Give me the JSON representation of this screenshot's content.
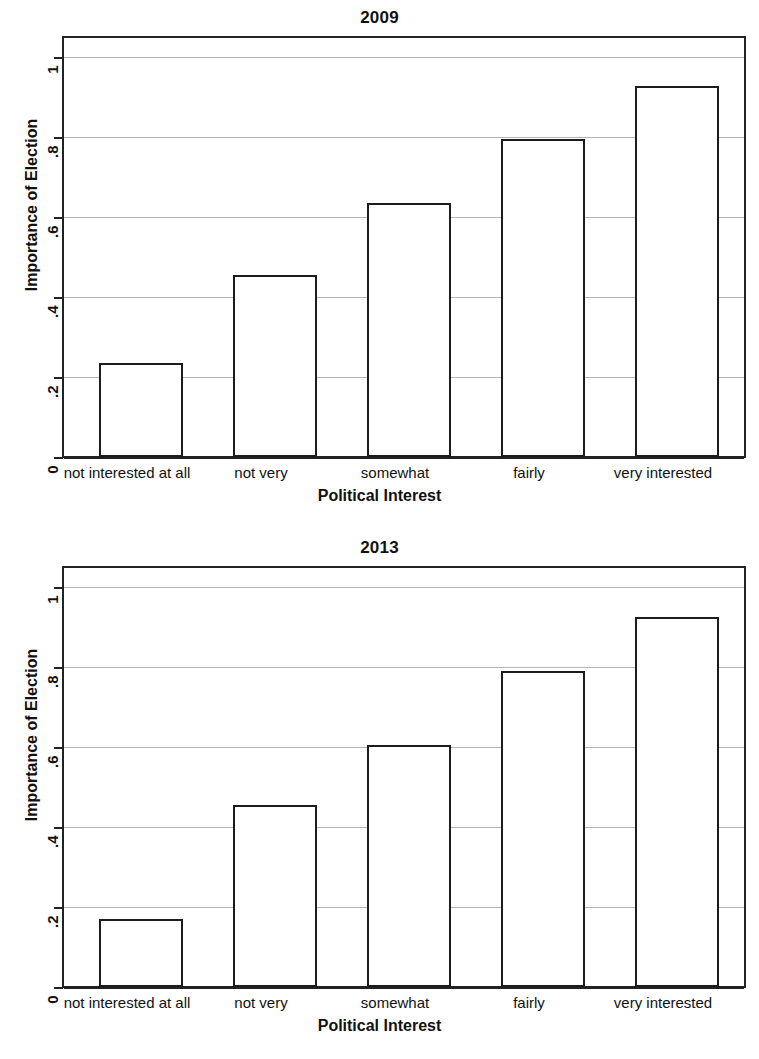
{
  "chart_data": [
    {
      "type": "bar",
      "title": "2009",
      "xlabel": "Political Interest",
      "ylabel": "Importance of Election",
      "categories": [
        "not interested at all",
        "not very",
        "somewhat",
        "fairly",
        "very interested"
      ],
      "values": [
        0.235,
        0.455,
        0.635,
        0.795,
        0.928
      ],
      "ylim": [
        0,
        1.055
      ],
      "yticks": [
        0,
        0.2,
        0.4,
        0.6,
        0.8,
        1
      ],
      "ytick_labels": [
        "0",
        ".2",
        ".4",
        ".6",
        ".8",
        "1"
      ],
      "grid": "horizontal",
      "legend": "none",
      "bar_fill": "#ffffff",
      "bar_stroke": "#1c1c1c",
      "grid_color": "#b4b4b4"
    },
    {
      "type": "bar",
      "title": "2013",
      "xlabel": "Political Interest",
      "ylabel": "Importance of Election",
      "categories": [
        "not interested at all",
        "not very",
        "somewhat",
        "fairly",
        "very interested"
      ],
      "values": [
        0.17,
        0.455,
        0.605,
        0.79,
        0.925
      ],
      "ylim": [
        0,
        1.055
      ],
      "yticks": [
        0,
        0.2,
        0.4,
        0.6,
        0.8,
        1
      ],
      "ytick_labels": [
        "0",
        ".2",
        ".4",
        ".6",
        ".8",
        "1"
      ],
      "grid": "horizontal",
      "legend": "none",
      "bar_fill": "#ffffff",
      "bar_stroke": "#1c1c1c",
      "grid_color": "#b4b4b4"
    }
  ],
  "panels": {
    "p2009": {
      "title": "2009",
      "ylabel": "Importance of Election",
      "xlabel": "Political Interest",
      "ytick_labels": [
        "1",
        ".8",
        ".6",
        ".4",
        ".2",
        "0"
      ],
      "categories": [
        "not interested at all",
        "not very",
        "somewhat",
        "fairly",
        "very interested"
      ]
    },
    "p2013": {
      "title": "2013",
      "ylabel": "Importance of Election",
      "xlabel": "Political Interest",
      "ytick_labels": [
        "1",
        ".8",
        ".6",
        ".4",
        ".2",
        "0"
      ],
      "categories": [
        "not interested at all",
        "not very",
        "somewhat",
        "fairly",
        "very interested"
      ]
    }
  }
}
